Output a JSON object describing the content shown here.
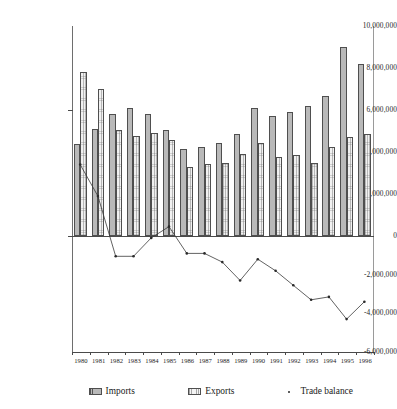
{
  "chart_data": {
    "type": "bar",
    "title": "",
    "subtitle": "",
    "xlabel": "",
    "ylabel": "",
    "categories": [
      "1980",
      "1981",
      "1982",
      "1983",
      "1984",
      "1985",
      "1986",
      "1987",
      "1988",
      "1989",
      "1990",
      "1991",
      "1992",
      "1993",
      "1994",
      "1995",
      "1996"
    ],
    "ylim": [
      -6000000,
      10000000
    ],
    "ytick_values": [
      10000000,
      8000000,
      6000000,
      4000000,
      2000000,
      0,
      -2000000,
      -4000000,
      -6000000
    ],
    "ytick_labels": [
      "10,000,000",
      "8,000,000",
      "6,000,000",
      "4,000,000",
      "2,000,000",
      "0",
      "-2,000,000",
      "-4,000,000",
      "-6,000,000"
    ],
    "grid": false,
    "legend_position": "bottom",
    "series": [
      {
        "name": "Imports",
        "type": "bar",
        "values": [
          4400000,
          5100000,
          5800000,
          6100000,
          5800000,
          5050000,
          4150000,
          4250000,
          4450000,
          4850000,
          6100000,
          5700000,
          5900000,
          6200000,
          6650000,
          9000000,
          8200000
        ]
      },
      {
        "name": "Exports",
        "type": "bar",
        "values": [
          7800000,
          7000000,
          5050000,
          4750000,
          4900000,
          4550000,
          3300000,
          3450000,
          3500000,
          3900000,
          4450000,
          3750000,
          3850000,
          3500000,
          4250000,
          4700000,
          4850000
        ]
      },
      {
        "name": "Trade balance",
        "type": "line",
        "values": [
          3400000,
          1900000,
          -1050000,
          -1050000,
          -100000,
          450000,
          -900000,
          -900000,
          -1350000,
          -2300000,
          -1200000,
          -1800000,
          -2550000,
          -3300000,
          -3150000,
          -4300000,
          -3400000
        ]
      }
    ]
  },
  "legend": {
    "items": [
      {
        "label": "Imports",
        "swatch": "imports-swatch-icon"
      },
      {
        "label": "Exports",
        "swatch": "exports-swatch-icon"
      },
      {
        "label": "Trade balance",
        "swatch": "trade-balance-marker-icon"
      }
    ]
  }
}
